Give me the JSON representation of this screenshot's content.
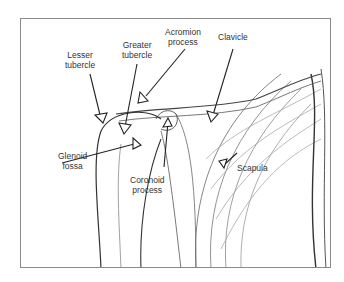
{
  "figure": {
    "labels": {
      "lesser_tubercle": [
        "Lesser",
        "tubercle"
      ],
      "greater_tubercle": [
        "Greater",
        "tubercle"
      ],
      "acromion_process": [
        "Acromion",
        "process"
      ],
      "clavicle": [
        "Clavicle"
      ],
      "glenoid_fossa": [
        "Glenoid",
        "fossa"
      ],
      "coronoid_process": [
        "Coronoid",
        "process"
      ],
      "scapula": [
        "Scapula"
      ]
    }
  }
}
